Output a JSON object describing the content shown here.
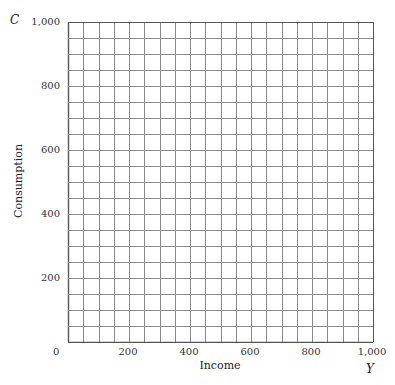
{
  "chart_data": {
    "type": "line",
    "title": "",
    "xlabel": "Income",
    "ylabel": "Consumption",
    "x_variable": "Y",
    "y_variable": "C",
    "xlim": [
      0,
      1000
    ],
    "ylim": [
      0,
      1000
    ],
    "x_ticks": [
      "0",
      "200",
      "400",
      "600",
      "800",
      "1,000"
    ],
    "y_ticks": [
      "200",
      "400",
      "600",
      "800",
      "1,000"
    ],
    "grid": true,
    "grid_step": 50,
    "grid_columns": 20,
    "grid_rows": 20,
    "series": []
  },
  "labels": {
    "y_var": "C",
    "x_var": "Y",
    "y_title": "Consumption",
    "x_title": "Income",
    "origin": "0",
    "y_ticks": [
      {
        "label": "1,000",
        "value": 1000
      },
      {
        "label": "800",
        "value": 800
      },
      {
        "label": "600",
        "value": 600
      },
      {
        "label": "400",
        "value": 400
      },
      {
        "label": "200",
        "value": 200
      }
    ],
    "x_ticks": [
      {
        "label": "200",
        "value": 200
      },
      {
        "label": "400",
        "value": 400
      },
      {
        "label": "600",
        "value": 600
      },
      {
        "label": "800",
        "value": 800
      },
      {
        "label": "1,000",
        "value": 1000
      }
    ]
  },
  "style": {
    "grid_color": "#8a8a8a",
    "border_color": "#555555"
  }
}
